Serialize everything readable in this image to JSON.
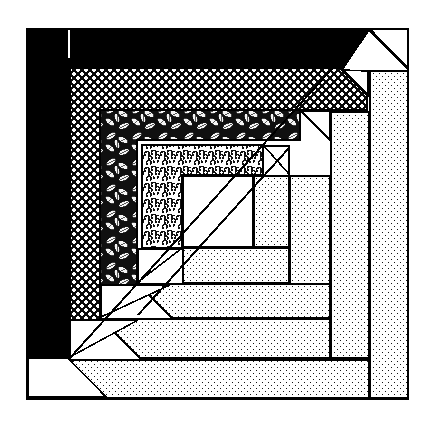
{
  "figure": {
    "name": "log-cabin-quilt-block-diagram",
    "title": "Log Cabin Quilt Block Piecing Diagram",
    "width": 431,
    "height": 426,
    "background_color": "#ffffff",
    "line_color": "#000000",
    "outline_stroke_width": 2.2
  },
  "frame": {
    "label": "block-outer-frame",
    "x": 27,
    "y": 29,
    "width": 381,
    "height": 370,
    "fill": "#ffffff"
  },
  "seam_tick": {
    "label": "seam-registration-tick",
    "x": 68,
    "y": 30,
    "width": 2.4,
    "height": 28,
    "color": "#ffffff"
  },
  "fabrics": [
    {
      "key": "solid-black",
      "name": "Solid Black",
      "swatch": "#000000",
      "role": "darkest outer log"
    },
    {
      "key": "dark-check",
      "name": "Dark Polka Dot / Check",
      "swatch": "#1a1a1a",
      "role": "dark second log"
    },
    {
      "key": "leaf-print",
      "name": "Dark Leaf Print",
      "swatch": "#2b2b2b",
      "role": "dark third log"
    },
    {
      "key": "small-floral",
      "name": "Light Small Floral",
      "swatch": "#f2f2f2",
      "role": "light inner log"
    },
    {
      "key": "light-dot",
      "name": "Light Dotted Tone",
      "swatch": "#e8e8e8",
      "role": "light outer logs"
    },
    {
      "key": "plain-white",
      "name": "Plain White",
      "swatch": "#ffffff",
      "role": "center square and light logs"
    }
  ],
  "patches": [
    {
      "id": 1,
      "name": "patch-black-outer-log",
      "fabric": "solid-black",
      "points": "27,29 368,29 408,69 408,89 99,89 99,329 69,359 27,359"
    },
    {
      "id": 2,
      "name": "patch-white-corner-top-right",
      "fabric": "plain-white",
      "points": "370,29 408,29 408,68"
    },
    {
      "id": 3,
      "name": "patch-white-corner-bot-left",
      "fabric": "plain-white",
      "points": "27,361 67,361 27,398"
    },
    {
      "id": 4,
      "name": "patch-dark-check-top-log",
      "fabric": "dark-check",
      "points": "70,68 340,68 367,95 367,110 100,110 100,330 85,345 70,345"
    },
    {
      "id": 5,
      "name": "patch-leaf-print-log",
      "fabric": "leaf-print",
      "points": "100,110 300,110 300,140 137,140 137,283 100,318"
    },
    {
      "id": 6,
      "name": "patch-small-floral-log",
      "fabric": "small-floral",
      "points": "142,145 263,145 263,175 182,175 182,248 142,248"
    },
    {
      "id": 7,
      "name": "patch-center-white-square",
      "fabric": "plain-white",
      "points": "183,176 253,176 253,247 183,247"
    },
    {
      "id": 8,
      "name": "patch-light-dot-inner-right",
      "fabric": "light-dot",
      "points": "254,176 289,176 289,247 254,247"
    },
    {
      "id": 9,
      "name": "patch-light-dot-inner-bottom",
      "fabric": "light-dot",
      "points": "183,248 289,248 289,283 212,283 183,283"
    },
    {
      "id": 10,
      "name": "patch-light-dot-mid-right",
      "fabric": "light-dot",
      "points": "290,176 330,176 330,318 290,318"
    },
    {
      "id": 11,
      "name": "patch-light-dot-mid-bottom",
      "fabric": "light-dot",
      "points": "138,284 330,284 330,318 172,318"
    },
    {
      "id": 12,
      "name": "patch-light-dot-outer-right",
      "fabric": "light-dot",
      "points": "331,112 369,112 369,358 331,358"
    },
    {
      "id": 13,
      "name": "patch-light-dot-outer-bottom",
      "fabric": "light-dot",
      "points": "101,319 330,319 330,358 140,358"
    },
    {
      "id": 14,
      "name": "patch-light-dot-edge-right",
      "fabric": "light-dot",
      "points": "370,70 408,70 408,398 370,398"
    },
    {
      "id": 15,
      "name": "patch-light-dot-edge-bottom",
      "fabric": "light-dot",
      "points": "69,360 369,360 369,398 107,398"
    },
    {
      "id": 16,
      "name": "patch-white-diagonal-1",
      "fabric": "plain-white",
      "points": "342,69 368,69 368,95"
    },
    {
      "id": 17,
      "name": "patch-white-diagonal-2",
      "fabric": "plain-white",
      "points": "301,111 330,111 330,140"
    },
    {
      "id": 18,
      "name": "patch-white-diagonal-3",
      "fabric": "plain-white",
      "points": "264,146 289,146 289,174"
    },
    {
      "id": 19,
      "name": "patch-white-diagonal-4",
      "fabric": "plain-white",
      "points": "138,249 181,249 138,282"
    },
    {
      "id": 20,
      "name": "patch-white-diagonal-5",
      "fabric": "plain-white",
      "points": "101,285 170,285 101,317"
    },
    {
      "id": 21,
      "name": "patch-white-diagonal-6",
      "fabric": "plain-white",
      "points": "70,320 138,320 70,357"
    },
    {
      "id": 22,
      "name": "patch-white-wedge-top-right",
      "fabric": "plain-white",
      "points": "369,71 408,71 408,69 369,30 342,70"
    },
    {
      "id": 23,
      "name": "patch-white-wedge-lower-left",
      "fabric": "plain-white",
      "points": "28,358 68,358 106,397 28,397"
    }
  ],
  "seams": [
    {
      "name": "seam-diagonal-main",
      "x1": 368,
      "y1": 29,
      "x2": 69,
      "y2": 359
    },
    {
      "name": "seam-diagonal-inner",
      "x1": 289,
      "y1": 148,
      "x2": 138,
      "y2": 315
    }
  ],
  "legend": {
    "visible": false,
    "caption": ""
  }
}
